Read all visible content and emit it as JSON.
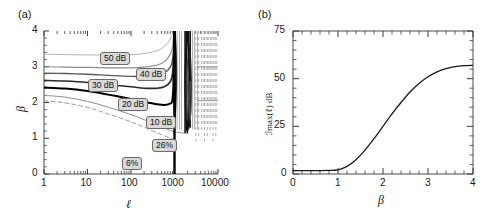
{
  "figure": {
    "width": 497,
    "height": 222,
    "background": "#ffffff",
    "panels": [
      {
        "tag": "(a)"
      },
      {
        "tag": "(b)"
      }
    ]
  },
  "chart_data": [
    {
      "type": "line",
      "panel": "(a)",
      "title": "",
      "xlabel": "ℓ",
      "ylabel": "β",
      "xscale": "log",
      "xlim": [
        1,
        10000
      ],
      "ylim": [
        0,
        4
      ],
      "xticks": [
        1,
        10,
        100,
        1000,
        10000
      ],
      "xticklabels": [
        "1",
        "10",
        "100",
        "1000",
        "10000"
      ],
      "yticks": [
        0,
        1,
        2,
        3,
        4
      ],
      "yticklabels": [
        "0",
        "1",
        "2",
        "3",
        "4"
      ],
      "grid": false,
      "legend": "inline-contour-labels",
      "description": "Contour map of maximum intensification vs loop length and beta, with a resonance band of near-vertical contours around l = 1000-10000.",
      "annotations": [
        {
          "text": "50 dB",
          "x_px": 100,
          "y_px": 52
        },
        {
          "text": "40 dB",
          "x_px": 136,
          "y_px": 68
        },
        {
          "text": "30 dB",
          "x_px": 88,
          "y_px": 79
        },
        {
          "text": "20 dB",
          "x_px": 118,
          "y_px": 98
        },
        {
          "text": "10 dB",
          "x_px": 146,
          "y_px": 116
        },
        {
          "text": "26%",
          "x_px": 152,
          "y_px": 139
        },
        {
          "text": "6%",
          "x_px": 122,
          "y_px": 157
        }
      ],
      "series": [
        {
          "name": "50 dB",
          "style": "solid",
          "color": "#b4b4b4",
          "width": 1.0,
          "beta_at_l1": 3.35,
          "points": [
            [
              1,
              3.35
            ],
            [
              3,
              3.34
            ],
            [
              10,
              3.33
            ],
            [
              30,
              3.33
            ],
            [
              100,
              3.34
            ],
            [
              200,
              3.37
            ],
            [
              400,
              3.45
            ],
            [
              600,
              3.58
            ],
            [
              800,
              3.78
            ],
            [
              950,
              4.0
            ]
          ]
        },
        {
          "name": "40 dB",
          "style": "solid",
          "color": "#8c8c8c",
          "width": 1.2,
          "beta_at_l1": 3.0,
          "points": [
            [
              1,
              3.0
            ],
            [
              3,
              2.99
            ],
            [
              10,
              2.98
            ],
            [
              30,
              2.97
            ],
            [
              100,
              2.97
            ],
            [
              200,
              2.99
            ],
            [
              400,
              3.05
            ],
            [
              600,
              3.15
            ],
            [
              800,
              3.35
            ],
            [
              900,
              3.55
            ],
            [
              980,
              4.0
            ]
          ]
        },
        {
          "name": "30 dB",
          "style": "solid",
          "color": "#5a5a5a",
          "width": 1.4,
          "beta_at_l1": 2.82,
          "points": [
            [
              1,
              2.82
            ],
            [
              3,
              2.81
            ],
            [
              10,
              2.79
            ],
            [
              30,
              2.76
            ],
            [
              100,
              2.73
            ],
            [
              200,
              2.73
            ],
            [
              400,
              2.76
            ],
            [
              600,
              2.84
            ],
            [
              800,
              2.99
            ],
            [
              900,
              3.2
            ],
            [
              980,
              3.7
            ],
            [
              1000,
              4.0
            ]
          ]
        },
        {
          "name": "20 dB",
          "style": "solid",
          "color": "#2a2a2a",
          "width": 1.6,
          "beta_at_l1": 2.62,
          "points": [
            [
              1,
              2.62
            ],
            [
              3,
              2.6
            ],
            [
              10,
              2.56
            ],
            [
              30,
              2.5
            ],
            [
              100,
              2.44
            ],
            [
              200,
              2.4
            ],
            [
              400,
              2.4
            ],
            [
              600,
              2.45
            ],
            [
              800,
              2.58
            ],
            [
              900,
              2.8
            ],
            [
              980,
              3.4
            ],
            [
              1000,
              4.0
            ]
          ]
        },
        {
          "name": "10 dB",
          "style": "solid",
          "color": "#000000",
          "width": 2.0,
          "beta_at_l1": 2.42,
          "points": [
            [
              1,
              2.42
            ],
            [
              3,
              2.39
            ],
            [
              10,
              2.32
            ],
            [
              30,
              2.22
            ],
            [
              100,
              2.1
            ],
            [
              200,
              2.02
            ],
            [
              400,
              1.95
            ],
            [
              600,
              1.93
            ],
            [
              800,
              1.97
            ],
            [
              900,
              2.1
            ],
            [
              980,
              2.9
            ],
            [
              1000,
              4.0
            ]
          ]
        },
        {
          "name": "26%",
          "style": "solid",
          "color": "#909090",
          "width": 1.0,
          "beta_at_l1": 2.2,
          "points": [
            [
              1,
              2.2
            ],
            [
              3,
              2.15
            ],
            [
              10,
              2.03
            ],
            [
              30,
              1.87
            ],
            [
              100,
              1.66
            ],
            [
              200,
              1.52
            ],
            [
              400,
              1.37
            ],
            [
              600,
              1.28
            ],
            [
              800,
              1.22
            ],
            [
              1000,
              1.18
            ],
            [
              1400,
              1.15
            ],
            [
              2000,
              1.13
            ]
          ]
        },
        {
          "name": "6%",
          "style": "dashed",
          "color": "#9a9a9a",
          "width": 1.0,
          "beta_at_l1": 2.05,
          "points": [
            [
              1,
              2.05
            ],
            [
              3,
              1.99
            ],
            [
              10,
              1.86
            ],
            [
              30,
              1.68
            ],
            [
              100,
              1.46
            ],
            [
              200,
              1.31
            ],
            [
              400,
              1.15
            ],
            [
              600,
              1.06
            ],
            [
              800,
              1.0
            ],
            [
              1000,
              0.96
            ]
          ]
        }
      ],
      "resonance_band": {
        "l_start": 900,
        "l_end": 10000,
        "note": "Dense near-vertical solid and dashed contour spikes"
      }
    },
    {
      "type": "line",
      "panel": "(b)",
      "title": "",
      "xlabel": "β",
      "ylabel": "ℐmax(ℓ) dB",
      "xscale": "linear",
      "xlim": [
        0,
        4
      ],
      "ylim": [
        0,
        75
      ],
      "xticks": [
        0,
        1,
        2,
        3,
        4
      ],
      "xticklabels": [
        "0",
        "1",
        "2",
        "3",
        "4"
      ],
      "yticks": [
        0,
        25,
        50,
        75
      ],
      "yticklabels": [
        "0",
        "25",
        "50",
        "75"
      ],
      "minor_xticks_per_major": 5,
      "minor_yticks_per_major": 5,
      "grid": false,
      "legend": "none",
      "series": [
        {
          "name": "Imax vs beta",
          "style": "solid",
          "color": "#1a1a1a",
          "width": 1.3,
          "x": [
            0,
            0.2,
            0.4,
            0.6,
            0.8,
            1.0,
            1.2,
            1.4,
            1.6,
            1.8,
            2.0,
            2.2,
            2.4,
            2.6,
            2.8,
            3.0,
            3.2,
            3.4,
            3.6,
            3.8,
            4.0
          ],
          "values": [
            1.8,
            1.8,
            1.8,
            1.8,
            1.9,
            2.2,
            4.0,
            7.5,
            12.5,
            18.5,
            25.0,
            31.5,
            37.5,
            43.0,
            47.5,
            51.0,
            53.6,
            55.3,
            56.3,
            56.8,
            57.0
          ]
        }
      ]
    }
  ]
}
